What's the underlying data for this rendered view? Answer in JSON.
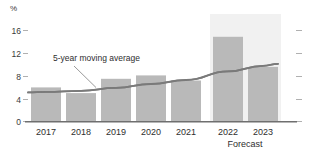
{
  "chart_data": {
    "type": "bar",
    "title": "",
    "subtitle": "",
    "xlabel": "",
    "ylabel": "%",
    "ylim": [
      0,
      18
    ],
    "grid": false,
    "categories": [
      "2017",
      "2018",
      "2019",
      "2020",
      "2021",
      "2022",
      "2023"
    ],
    "ytick_labels": [
      "0",
      "4",
      "8",
      "12",
      "16"
    ],
    "ytick_values": [
      0,
      4,
      8,
      12,
      16
    ],
    "series": [
      {
        "name": "annual value",
        "type": "bar",
        "values": [
          6.0,
          5.0,
          7.5,
          8.1,
          7.2,
          14.9,
          9.6
        ],
        "color": "#b9b9b9"
      },
      {
        "name": "5-year moving average",
        "type": "line",
        "values": [
          5.2,
          5.4,
          5.9,
          6.6,
          7.3,
          8.8,
          9.8
        ],
        "color": "#7a7a7a"
      }
    ],
    "annotations": [
      {
        "text": "5-year moving average",
        "target_series": "5-year moving average"
      }
    ],
    "regions": [
      {
        "label": "Forecast",
        "from": "2022",
        "to": "2023",
        "color": "#f1f1f1"
      }
    ],
    "axis_colors": {
      "baseline": "#6f6f6f",
      "tick": "#b0b0b0",
      "text": "#2e2e2e"
    }
  },
  "labels": {
    "unit": "%",
    "annotation": "5-year moving average",
    "forecast": "Forecast"
  }
}
